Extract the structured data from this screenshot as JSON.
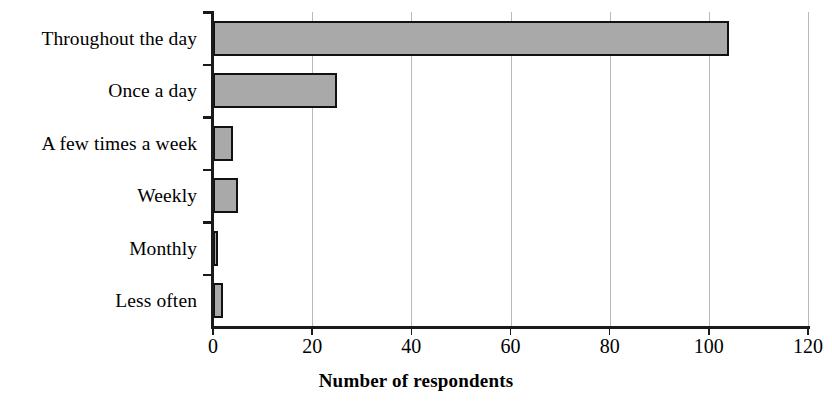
{
  "chart_data": {
    "type": "bar",
    "orientation": "horizontal",
    "title": "",
    "xlabel": "Number of respondents",
    "ylabel": "",
    "categories": [
      "Throughout the day",
      "Once a day",
      "A few times a week",
      "Weekly",
      "Monthly",
      "Less often"
    ],
    "values": [
      104,
      25,
      4,
      5,
      1,
      2
    ],
    "xlim": [
      0,
      120
    ],
    "xticks": [
      0,
      20,
      40,
      60,
      80,
      100,
      120
    ],
    "xtick_labels": [
      "0",
      "20",
      "40",
      "60",
      "80",
      "100",
      "120"
    ],
    "grid": "vertical",
    "legend": "none",
    "bar_fill_color": "#a9a9a9",
    "bar_edge_color": "#111111",
    "axis_color": "#1a1a1a",
    "gridline_color": "#b9b9b9",
    "background_color": "#ffffff"
  }
}
